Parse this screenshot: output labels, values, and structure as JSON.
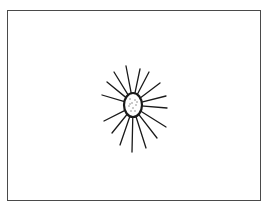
{
  "figure": {
    "frame": {
      "border_color": "#4a4a4a",
      "background": "#ffffff"
    },
    "organism": {
      "center": [
        133,
        105
      ],
      "body_rx": 9,
      "body_ry": 12,
      "spine_color": "#1a1a1a",
      "spines": [
        [
          126,
          66
        ],
        [
          114,
          72
        ],
        [
          107,
          82
        ],
        [
          102,
          95
        ],
        [
          149,
          72
        ],
        [
          160,
          83
        ],
        [
          166,
          96
        ],
        [
          167,
          108
        ],
        [
          104,
          121
        ],
        [
          112,
          133
        ],
        [
          120,
          145
        ],
        [
          132,
          152
        ],
        [
          146,
          148
        ],
        [
          157,
          138
        ],
        [
          166,
          127
        ],
        [
          140,
          69
        ]
      ]
    }
  }
}
